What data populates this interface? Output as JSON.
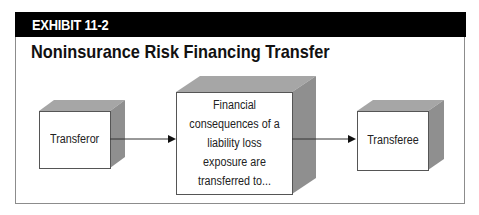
{
  "exhibit": {
    "label": "EXHIBIT 11-2",
    "title": "Noninsurance Risk Financing Transfer"
  },
  "diagram": {
    "nodes": [
      {
        "id": "transferor",
        "label": "Transferor"
      },
      {
        "id": "consequences",
        "label": "Financial consequences of a liability loss exposure are transferred to..."
      },
      {
        "id": "transferee",
        "label": "Transferee"
      }
    ],
    "edges": [
      {
        "from": "transferor",
        "to": "consequences"
      },
      {
        "from": "consequences",
        "to": "transferee"
      }
    ],
    "colors": {
      "header_bar": "#000000",
      "cube_face": "#ffffff",
      "cube_side": "#8f8f8f",
      "cube_top": "#a6a6a6",
      "outline": "#555555"
    }
  }
}
